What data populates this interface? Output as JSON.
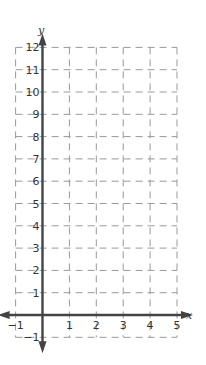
{
  "chart_data": {
    "type": "line",
    "title": "",
    "xlabel": "x",
    "ylabel": "y",
    "xlim": [
      -1,
      5
    ],
    "ylim": [
      -1,
      12
    ],
    "grid": true,
    "grid_style": "dashed",
    "x_ticks": [
      "-1",
      "1",
      "2",
      "3",
      "4",
      "5"
    ],
    "y_ticks": [
      "-1",
      "1",
      "2",
      "3",
      "4",
      "5",
      "6",
      "7",
      "8",
      "9",
      "10",
      "11",
      "12"
    ],
    "series": [],
    "axis_color": "#444444",
    "grid_color": "#999999"
  }
}
